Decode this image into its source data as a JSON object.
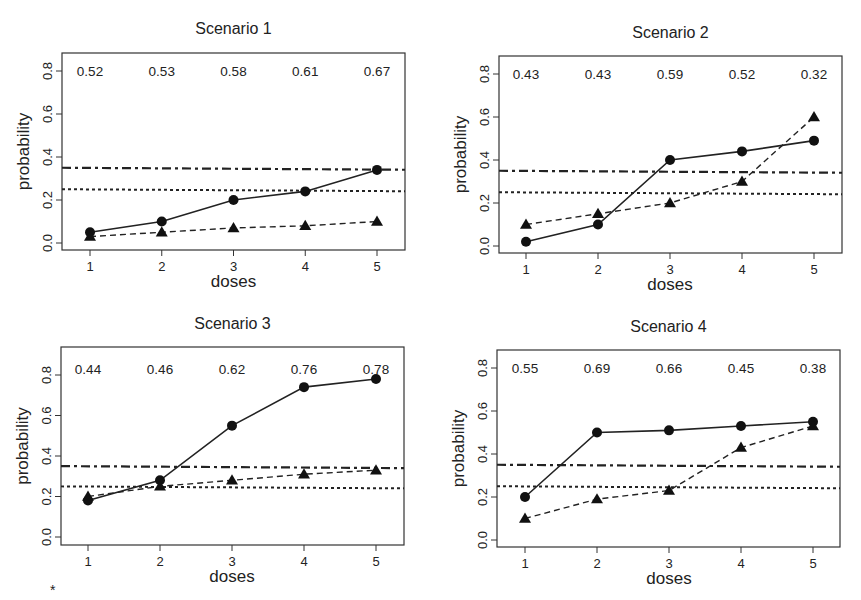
{
  "chart_data": [
    {
      "type": "line",
      "title": "Scenario 1",
      "xlabel": "doses",
      "ylabel": "probability",
      "x": [
        1,
        2,
        3,
        4,
        5
      ],
      "xticks": [
        "1",
        "2",
        "3",
        "4",
        "5"
      ],
      "yticks": [
        "0.0",
        "0.2",
        "0.4",
        "0.6",
        "0.8"
      ],
      "ylim": [
        0,
        0.85
      ],
      "series": [
        {
          "name": "solid-circle",
          "style": "solid",
          "marker": "circle",
          "values": [
            0.05,
            0.1,
            0.2,
            0.24,
            0.34
          ]
        },
        {
          "name": "dashed-triangle",
          "style": "dashed",
          "marker": "triangle",
          "values": [
            0.03,
            0.05,
            0.07,
            0.08,
            0.1
          ]
        }
      ],
      "reference_lines": [
        {
          "style": "dashdot",
          "y": 0.35
        },
        {
          "style": "dotted",
          "y": 0.25
        }
      ],
      "annotations": [
        "0.52",
        "0.53",
        "0.58",
        "0.61",
        "0.67"
      ],
      "annotation_y": 0.8
    },
    {
      "type": "line",
      "title": "Scenario 2",
      "xlabel": "doses",
      "ylabel": "probability",
      "x": [
        1,
        2,
        3,
        4,
        5
      ],
      "xticks": [
        "1",
        "2",
        "3",
        "4",
        "5"
      ],
      "yticks": [
        "0.0",
        "0.2",
        "0.4",
        "0.6",
        "0.8"
      ],
      "ylim": [
        0,
        0.85
      ],
      "series": [
        {
          "name": "solid-circle",
          "style": "solid",
          "marker": "circle",
          "values": [
            0.02,
            0.1,
            0.4,
            0.44,
            0.49
          ]
        },
        {
          "name": "dashed-triangle",
          "style": "dashed",
          "marker": "triangle",
          "values": [
            0.1,
            0.15,
            0.2,
            0.3,
            0.6
          ]
        }
      ],
      "reference_lines": [
        {
          "style": "dashdot",
          "y": 0.35
        },
        {
          "style": "dotted",
          "y": 0.25
        }
      ],
      "annotations": [
        "0.43",
        "0.43",
        "0.59",
        "0.52",
        "0.32"
      ],
      "annotation_y": 0.8
    },
    {
      "type": "line",
      "title": "Scenario 3",
      "xlabel": "doses",
      "ylabel": "probability",
      "x": [
        1,
        2,
        3,
        4,
        5
      ],
      "xticks": [
        "1",
        "2",
        "3",
        "4",
        "5"
      ],
      "yticks": [
        "0.0",
        "0.2",
        "0.4",
        "0.6",
        "0.8"
      ],
      "ylim": [
        0,
        0.85
      ],
      "series": [
        {
          "name": "solid-circle",
          "style": "solid",
          "marker": "circle",
          "values": [
            0.18,
            0.28,
            0.55,
            0.74,
            0.78
          ]
        },
        {
          "name": "dashed-triangle",
          "style": "dashed",
          "marker": "triangle",
          "values": [
            0.2,
            0.25,
            0.28,
            0.31,
            0.33
          ]
        }
      ],
      "reference_lines": [
        {
          "style": "dashdot",
          "y": 0.35
        },
        {
          "style": "dotted",
          "y": 0.25
        }
      ],
      "annotations": [
        "0.44",
        "0.46",
        "0.62",
        "0.76",
        "0.78"
      ],
      "annotation_y": 0.83
    },
    {
      "type": "line",
      "title": "Scenario 4",
      "xlabel": "doses",
      "ylabel": "probability",
      "x": [
        1,
        2,
        3,
        4,
        5
      ],
      "xticks": [
        "1",
        "2",
        "3",
        "4",
        "5"
      ],
      "yticks": [
        "0.0",
        "0.2",
        "0.4",
        "0.6",
        "0.8"
      ],
      "ylim": [
        0,
        0.85
      ],
      "series": [
        {
          "name": "solid-circle",
          "style": "solid",
          "marker": "circle",
          "values": [
            0.2,
            0.5,
            0.51,
            0.53,
            0.55
          ]
        },
        {
          "name": "dashed-triangle",
          "style": "dashed",
          "marker": "triangle",
          "values": [
            0.1,
            0.19,
            0.23,
            0.43,
            0.53
          ]
        }
      ],
      "reference_lines": [
        {
          "style": "dashdot",
          "y": 0.35
        },
        {
          "style": "dotted",
          "y": 0.25
        }
      ],
      "annotations": [
        "0.55",
        "0.69",
        "0.66",
        "0.45",
        "0.38"
      ],
      "annotation_y": 0.8
    }
  ],
  "footnote": "*"
}
